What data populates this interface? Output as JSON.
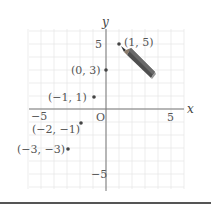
{
  "diagram": {
    "type": "coordinate-plane",
    "x_axis_label": "x",
    "y_axis_label": "y",
    "origin_label": "O",
    "range": {
      "x": [
        -6,
        6
      ],
      "y": [
        -6,
        6
      ]
    },
    "ticks": {
      "x_neg": "−5",
      "x_pos": "5",
      "y_pos": "5",
      "y_neg": "−5"
    },
    "points": [
      {
        "x": 1,
        "y": 5,
        "label": "(1,  5)"
      },
      {
        "x": 0,
        "y": 3,
        "label": "(0,  3)"
      },
      {
        "x": -1,
        "y": 1,
        "label": "(−1,  1)"
      },
      {
        "x": -2,
        "y": -1,
        "label": "(−2, −1)"
      },
      {
        "x": -3,
        "y": -3,
        "label": "(−3, −3)"
      }
    ],
    "decoration": "pencil-icon",
    "colors": {
      "grid": "#e6e6e6",
      "axis": "#666666",
      "point": "#444444",
      "pencil": "#555555"
    }
  }
}
